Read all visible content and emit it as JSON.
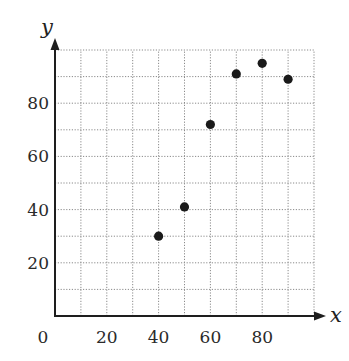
{
  "chart_data": {
    "type": "scatter",
    "title": "",
    "xlabel": "x",
    "ylabel": "y",
    "xlim": [
      0,
      100
    ],
    "ylim": [
      0,
      100
    ],
    "grid": true,
    "grid_step": 10,
    "x_ticks": [
      0,
      20,
      40,
      60,
      80
    ],
    "y_ticks": [
      20,
      40,
      60,
      80
    ],
    "x_tick_labels": [
      "0",
      "20",
      "40",
      "60",
      "80"
    ],
    "y_tick_labels": [
      "20",
      "40",
      "60",
      "80"
    ],
    "series": [
      {
        "name": "data",
        "points": [
          {
            "x": 40,
            "y": 30
          },
          {
            "x": 50,
            "y": 41
          },
          {
            "x": 60,
            "y": 72
          },
          {
            "x": 70,
            "y": 91
          },
          {
            "x": 80,
            "y": 95
          },
          {
            "x": 90,
            "y": 89
          }
        ]
      }
    ]
  }
}
